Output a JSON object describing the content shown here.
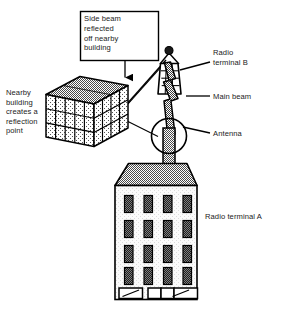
{
  "figure": {
    "type": "radio-link-reflection-diagram",
    "background_color": "#ffffff",
    "ink_color": "#1a1a1a"
  },
  "callout": {
    "text": "Side beam\nreflected\noff nearby\nbuilding",
    "lines": [
      "Side beam",
      "reflected",
      "off nearby",
      "building"
    ],
    "border_color": "#000000",
    "fill_color": "#ffffff"
  },
  "labels": {
    "nearby_building": "Nearby\nbuilding\ncreates a\nreflection\npoint",
    "nearby_building_lines": [
      "Nearby",
      "building",
      "creates a",
      "reflection",
      "point"
    ],
    "radio_terminal_b": "Radio\nterminal B",
    "radio_terminal_b_lines": [
      "Radio",
      "terminal B"
    ],
    "main_beam": "Main beam",
    "antenna": "Antenna",
    "radio_terminal_a": "Radio terminal A"
  },
  "elements": {
    "nearby_building": {
      "name": "Nearby building",
      "shape": "isometric-box",
      "roof_fill": "#8a8a8a",
      "wall_fill": "#d8d8d8",
      "grid_rows": 3,
      "grid_cols": 4
    },
    "radio_terminal_b": {
      "name": "Radio terminal B",
      "shape": "lattice-mast-tower",
      "fill": "#ffffff",
      "knob_fill": "#1a1a1a",
      "grid_rows": 4,
      "grid_cols": 3
    },
    "main_beam": {
      "name": "Main beam",
      "shape": "tapered-zigzag-bolt",
      "fill": "#9a9a9a",
      "stroke": "#000000"
    },
    "side_beam": {
      "name": "Side beam reflected off nearby building",
      "shape": "two-segment-reflected-ray",
      "stroke": "#000000"
    },
    "antenna": {
      "name": "Antenna",
      "shape": "circle-with-mast",
      "circle_fill": "#ffffff",
      "mast_fill": "#9a9a9a"
    },
    "radio_terminal_a": {
      "name": "Radio terminal A",
      "shape": "building",
      "roof_fill": "#8a8a8a",
      "wall_fill": "#f2f2f2",
      "window_fill": "#2a2a2a",
      "window_rows": 4,
      "window_cols": 4,
      "ground_floor_bays": 3
    }
  }
}
